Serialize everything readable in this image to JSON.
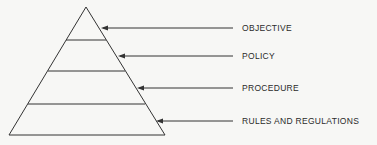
{
  "diagram": {
    "type": "pyramid-hierarchy",
    "levels": [
      {
        "label": "OBJECTIVE",
        "arrow_y": 28,
        "tip_x": 101
      },
      {
        "label": "POLICY",
        "arrow_y": 56,
        "tip_x": 118
      },
      {
        "label": "PROCEDURE",
        "arrow_y": 88,
        "tip_x": 137
      },
      {
        "label": "RULES AND REGULATIONS",
        "arrow_y": 121,
        "tip_x": 156
      }
    ],
    "colors": {
      "line": "#333333",
      "background": "#f7f7f5"
    }
  }
}
